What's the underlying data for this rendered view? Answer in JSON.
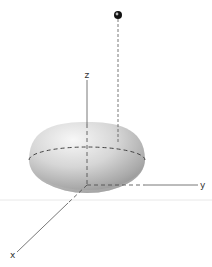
{
  "figure": {
    "type": "3d-hemisphere-diagram",
    "axes": {
      "x_label": "x",
      "y_label": "y",
      "z_label": "z"
    },
    "elements": [
      "hemisphere",
      "equator-dashed-circle",
      "point-above-hemisphere",
      "dashed-projection-line"
    ],
    "colors": {
      "axis": "#555555",
      "hemisphere_light": "#f4f4f4",
      "hemisphere_dark": "#9a9a9a",
      "dash": "#333333",
      "point": "#111111"
    }
  }
}
